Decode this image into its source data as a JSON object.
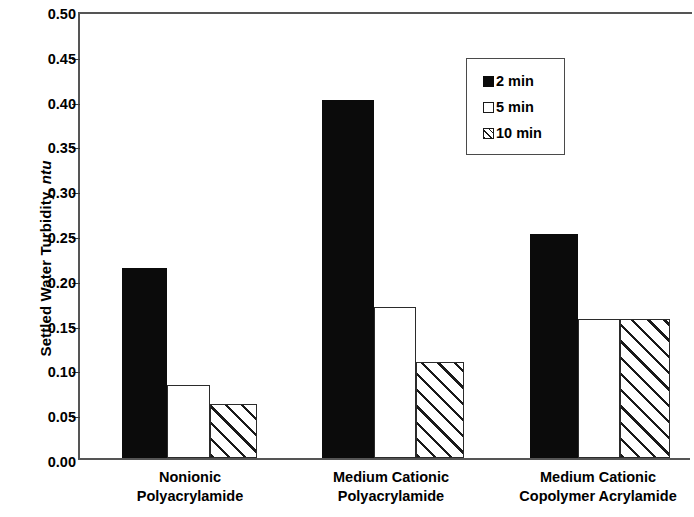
{
  "chart_data": {
    "type": "bar",
    "title": "",
    "xlabel": "",
    "ylabel": "Settled Water Turbidity, ntu",
    "ylabel_plain": "Settled Water Turbidity,",
    "ylabel_unit_italic": "ntu",
    "ylim": [
      0.0,
      0.5
    ],
    "ytick_step": 0.05,
    "ytick_labels": [
      "0.50",
      "0.45",
      "0.40",
      "0.35",
      "0.30",
      "0.25",
      "0.20",
      "0.15",
      "0.10",
      "0.05",
      "0.00"
    ],
    "ytick_values": [
      0.5,
      0.45,
      0.4,
      0.35,
      0.3,
      0.25,
      0.2,
      0.15,
      0.1,
      0.05,
      0.0
    ],
    "grid": false,
    "legend_position": "upper-right-inside",
    "categories": [
      "Nonionic Polyacrylamide",
      "Medium Cationic Polyacrylamide",
      "Medium Cationic Copolymer Acrylamide"
    ],
    "category_lines": [
      [
        "Nonionic",
        "Polyacrylamide"
      ],
      [
        "Medium Cationic",
        "Polyacrylamide"
      ],
      [
        "Medium Cationic",
        "Copolymer Acrylamide"
      ]
    ],
    "series": [
      {
        "name": "2 min",
        "fill": "fill-solid",
        "values": [
          0.212,
          0.4,
          0.25
        ]
      },
      {
        "name": "5 min",
        "fill": "fill-open",
        "values": [
          0.082,
          0.168,
          0.155
        ]
      },
      {
        "name": "10 min",
        "fill": "fill-hatch",
        "values": [
          0.06,
          0.107,
          0.155
        ]
      }
    ]
  },
  "legend": {
    "entries": [
      {
        "label": "2 min",
        "fill": "fill-solid"
      },
      {
        "label": "5 min",
        "fill": "fill-open"
      },
      {
        "label": "10 min",
        "fill": "fill-hatch"
      }
    ]
  },
  "colors": {
    "solid_fill": "#0b0b0b",
    "open_fill": "#ffffff",
    "outline": "#2b2b2b",
    "axis": "#555555",
    "background": "#ffffff"
  }
}
